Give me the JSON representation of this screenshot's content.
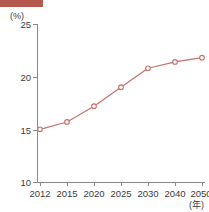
{
  "banner": {
    "color": "#b5594f"
  },
  "axes": {
    "y_unit_label": "(%)",
    "x_unit_label": "(年)",
    "y_ticks": [
      "25",
      "20",
      "15",
      "10"
    ],
    "x_ticks": [
      "2012",
      "2015",
      "2020",
      "2025",
      "2030",
      "2040",
      "2050"
    ]
  },
  "series_color": "#c4706b",
  "marker_fill": "#ffffff",
  "caption": "",
  "chart_data": {
    "type": "line",
    "title": "",
    "xlabel": "(年)",
    "ylabel": "(%)",
    "categories": [
      "2012",
      "2015",
      "2020",
      "2025",
      "2030",
      "2040",
      "2050"
    ],
    "x": [
      2012,
      2015,
      2020,
      2025,
      2030,
      2040,
      2050
    ],
    "values": [
      15.0,
      15.7,
      17.2,
      19.0,
      20.8,
      21.4,
      21.8
    ],
    "series": [
      {
        "name": "",
        "values": [
          15.0,
          15.7,
          17.2,
          19.0,
          20.8,
          21.4,
          21.8
        ]
      }
    ],
    "ylim": [
      10,
      25
    ],
    "ytick_values": [
      10,
      15,
      20,
      25
    ],
    "grid": false,
    "legend": false,
    "markers": "circle",
    "line_color": "#c4706b"
  }
}
